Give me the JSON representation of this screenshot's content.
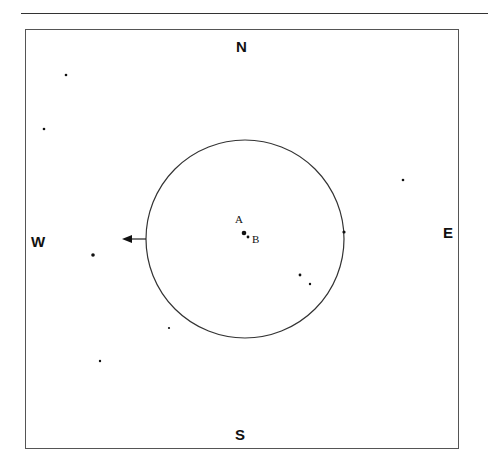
{
  "directions": {
    "north": "N",
    "south": "S",
    "east": "E",
    "west": "W"
  },
  "labels": {
    "a": "A",
    "b": "B"
  },
  "colors": {
    "ink": "#111111",
    "frame": "#555555",
    "background": "#ffffff"
  }
}
